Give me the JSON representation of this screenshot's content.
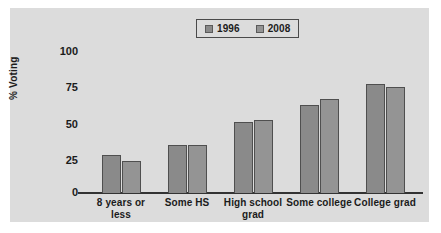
{
  "chart_data": {
    "type": "bar",
    "title": "",
    "xlabel": "",
    "ylabel": "% Voting",
    "categories": [
      "8 years or\nless",
      "Some HS",
      "High school\ngrad",
      "Some college",
      "College grad"
    ],
    "category_lines": [
      [
        "8 years or",
        "less"
      ],
      [
        "Some HS"
      ],
      [
        "High school",
        "grad"
      ],
      [
        "Some college"
      ],
      [
        "College grad"
      ]
    ],
    "series": [
      {
        "name": "1996",
        "color": "#8a8a8a",
        "values": [
          26,
          33,
          48,
          60,
          74
        ]
      },
      {
        "name": "2008",
        "color": "#949494",
        "values": [
          22,
          33,
          50,
          64,
          72
        ]
      }
    ],
    "ylim": [
      0,
      100
    ],
    "yticks": [
      100,
      75,
      50,
      25,
      0
    ],
    "ytick_labels": [
      "100",
      "75",
      "50",
      "25",
      "0"
    ],
    "grid": false,
    "legend_position": "top-center"
  },
  "legend": {
    "entries": [
      {
        "label": "1996",
        "swatch": "legend-swatch-1996"
      },
      {
        "label": "2008",
        "swatch": "legend-swatch-2008"
      }
    ]
  },
  "colors": {
    "panel_background": "#dcdcdc",
    "axis": "#333333",
    "text": "#1b1b1b",
    "series_1996": "#8a8a8a",
    "series_2008": "#949494",
    "bar_outline": "#4f4f4f"
  }
}
